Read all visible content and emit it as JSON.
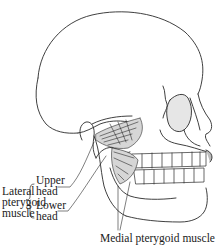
{
  "figure": {
    "colors": {
      "line": "#2a2a2a",
      "muscle_fill": "#d6d6d6",
      "bone_fill": "#ffffff",
      "shade": "#bdbdbd"
    }
  },
  "labels": {
    "lateral_pterygoid": {
      "line1": "Lateral",
      "line2": "pterygoid",
      "line3": "muscle"
    },
    "upper_head": {
      "line1": "Upper",
      "line2": "head"
    },
    "lower_head": {
      "line1": "Lower",
      "line2": "head"
    },
    "medial_pterygoid": "Medial pterygoid muscle"
  }
}
